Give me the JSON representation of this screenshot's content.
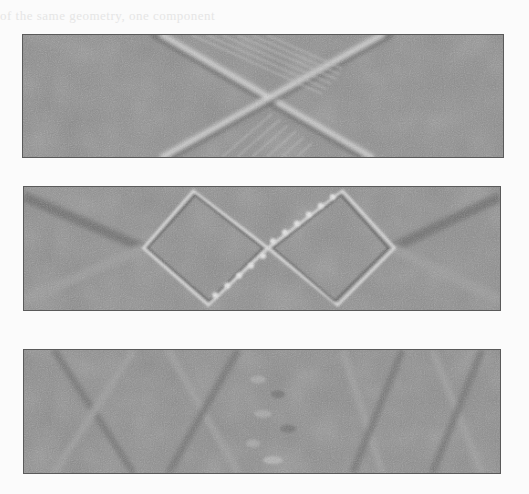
{
  "page": {
    "bleed_text": "of the same geometry, one component",
    "background_color": "#fbfbfb"
  },
  "figures": [
    {
      "id": "panel-1",
      "description": "X-shaped crossing of two wave packets with interference fringes",
      "background_color": "#8b8b8b"
    },
    {
      "id": "panel-2",
      "description": "Two adjacent diamond-shaped wave fronts with beaded edges",
      "background_color": "#8b8b8b"
    },
    {
      "id": "panel-3",
      "description": "Noisy pattern with diagonal bands and central textured region",
      "background_color": "#8b8b8b"
    }
  ]
}
